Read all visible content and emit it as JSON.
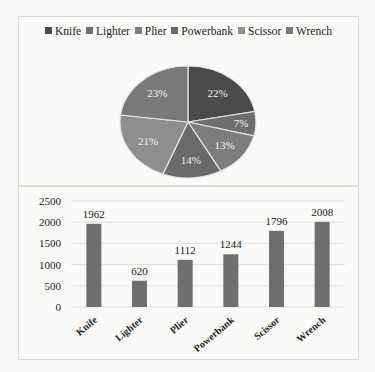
{
  "chart_data": [
    {
      "type": "pie",
      "title": "",
      "legend_position": "top",
      "categories": [
        "Knife",
        "Lighter",
        "Plier",
        "Powerbank",
        "Scissor",
        "Wrench"
      ],
      "values": [
        22,
        7,
        13,
        14,
        21,
        23
      ],
      "labels": [
        "22%",
        "7%",
        "13%",
        "14%",
        "21%",
        "23%"
      ],
      "colors": [
        "#4a4a4a",
        "#6e6e6e",
        "#7d7d7d",
        "#6a6a6a",
        "#8e8e8e",
        "#7a7a7a"
      ]
    },
    {
      "type": "bar",
      "title": "",
      "categories": [
        "Knife",
        "Lighter",
        "Plier",
        "Powerbank",
        "Scissor",
        "Wrench"
      ],
      "values": [
        1962,
        620,
        1112,
        1244,
        1796,
        2008
      ],
      "data_labels": [
        "1962",
        "620",
        "1112",
        "1244",
        "1796",
        "2008"
      ],
      "xlabel": "",
      "ylabel": "",
      "ylim": [
        0,
        2500
      ],
      "yticks": [
        "0",
        "500",
        "1000",
        "1500",
        "2000",
        "2500"
      ],
      "grid": true,
      "bar_color": "#6f6f6f"
    }
  ]
}
